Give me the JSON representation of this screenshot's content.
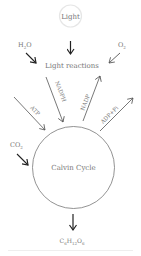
{
  "diagram": {
    "nodes": {
      "light": {
        "label": "Light"
      },
      "light_reactions": {
        "label": "Light reactions"
      },
      "calvin_cycle": {
        "label": "Calvin Cycle"
      }
    },
    "inputs": {
      "h2o": {
        "base": "H",
        "sub": "2",
        "rest": "O"
      },
      "o2": {
        "base": "O",
        "sub": "2"
      },
      "co2": {
        "base": "CO",
        "sub": "2"
      }
    },
    "links": {
      "atp": {
        "label": "ATP"
      },
      "nadph": {
        "label": "NADPH"
      },
      "nadp": {
        "label": "NADP"
      },
      "adp_pi": {
        "label": "ADP+Pi"
      }
    },
    "output": {
      "glucose": {
        "c": "C",
        "c_sub": "6",
        "h": "H",
        "h_sub": "12",
        "o": "O",
        "o_sub": "6"
      }
    },
    "colors": {
      "arrow_bold": "#222222",
      "arrow_thin": "#555555",
      "circle": "#777777",
      "light_circle": "#e6e6e6",
      "text": "#777777"
    }
  }
}
